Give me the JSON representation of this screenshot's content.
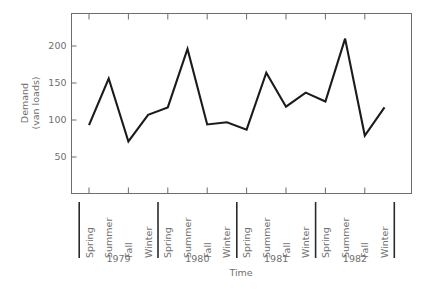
{
  "chart_data": {
    "type": "line",
    "title": "",
    "xlabel": "Time",
    "ylabel": "Demand\n(van loads)",
    "ylabel_line1": "Demand",
    "ylabel_line2": "(van loads)",
    "ylim": [
      0,
      235
    ],
    "yticks": [
      50,
      100,
      150,
      200
    ],
    "ytick_labels": [
      "50",
      "100",
      "150",
      "200"
    ],
    "grid": false,
    "legend": null,
    "x": [
      "Spring 1979",
      "Summer 1979",
      "Fall 1979",
      "Winter 1979",
      "Spring 1980",
      "Summer 1980",
      "Fall 1980",
      "Winter 1980",
      "Spring 1981",
      "Summer 1981",
      "Fall 1981",
      "Winter 1981",
      "Spring 1982",
      "Summer 1982",
      "Fall 1982",
      "Winter 1982"
    ],
    "categories": [
      "Spring",
      "Summer",
      "Fall",
      "Winter",
      "Spring",
      "Summer",
      "Fall",
      "Winter",
      "Spring",
      "Summer",
      "Fall",
      "Winter",
      "Spring",
      "Summer",
      "Fall",
      "Winter"
    ],
    "values": [
      93,
      156,
      71,
      107,
      117,
      196,
      94,
      97,
      87,
      164,
      118,
      137,
      125,
      210,
      79,
      117
    ],
    "groups": [
      {
        "year": "1979",
        "seasons": [
          "Spring",
          "Summer",
          "Fall",
          "Winter"
        ],
        "values": [
          93,
          156,
          71,
          107
        ]
      },
      {
        "year": "1980",
        "seasons": [
          "Spring",
          "Summer",
          "Fall",
          "Winter"
        ],
        "values": [
          117,
          196,
          94,
          97
        ]
      },
      {
        "year": "1981",
        "seasons": [
          "Spring",
          "Summer",
          "Fall",
          "Winter"
        ],
        "values": [
          87,
          164,
          118,
          137
        ]
      },
      {
        "year": "1982",
        "seasons": [
          "Spring",
          "Summer",
          "Fall",
          "Winter"
        ],
        "values": [
          125,
          210,
          79,
          117
        ]
      }
    ],
    "line_color": "#1b1b1b",
    "axis_color": "#6d6d6d",
    "text_color": "#707070"
  }
}
